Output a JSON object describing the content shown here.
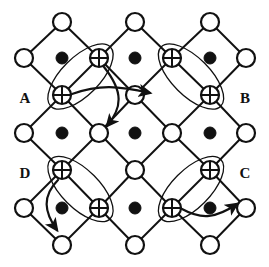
{
  "figure": {
    "width": 269,
    "height": 267,
    "background_color": "#ffffff",
    "stroke_color": "#111111",
    "fill_open": "#ffffff",
    "fill_solid": "#111111"
  },
  "labels": [
    {
      "id": "A",
      "text": "A",
      "x": 25,
      "y": 100
    },
    {
      "id": "B",
      "text": "B",
      "x": 245,
      "y": 100
    },
    {
      "id": "D",
      "text": "D",
      "x": 25,
      "y": 175
    },
    {
      "id": "C",
      "text": "C",
      "x": 245,
      "y": 175
    }
  ],
  "geometry": {
    "rows_y": [
      22,
      58,
      95,
      133,
      170,
      208,
      245
    ],
    "cols_x": [
      24,
      62,
      99,
      135,
      172,
      210,
      246
    ],
    "node_radius_open": 9,
    "node_radius_crossed": 9,
    "dot_radius": 6,
    "edge_width": 2.0,
    "ellipse_width": 1.3,
    "arrow_width": 2.2
  },
  "nodes": {
    "open_circles": [
      {
        "x": 62,
        "y": 22,
        "name": "node-r0-c1"
      },
      {
        "x": 135,
        "y": 22,
        "name": "node-r0-c3"
      },
      {
        "x": 210,
        "y": 22,
        "name": "node-r0-c5"
      },
      {
        "x": 24,
        "y": 58,
        "name": "node-r1-c0"
      },
      {
        "x": 246,
        "y": 58,
        "name": "node-r1-c6"
      },
      {
        "x": 135,
        "y": 95,
        "name": "node-r2-c3"
      },
      {
        "x": 24,
        "y": 133,
        "name": "node-r3-c0"
      },
      {
        "x": 99,
        "y": 133,
        "name": "node-r3-c2"
      },
      {
        "x": 172,
        "y": 133,
        "name": "node-r3-c4"
      },
      {
        "x": 246,
        "y": 133,
        "name": "node-r3-c6"
      },
      {
        "x": 135,
        "y": 170,
        "name": "node-r4-c3"
      },
      {
        "x": 24,
        "y": 208,
        "name": "node-r5-c0"
      },
      {
        "x": 246,
        "y": 208,
        "name": "node-r5-c6"
      },
      {
        "x": 62,
        "y": 245,
        "name": "node-r6-c1"
      },
      {
        "x": 135,
        "y": 245,
        "name": "node-r6-c3"
      },
      {
        "x": 210,
        "y": 245,
        "name": "node-r6-c5"
      }
    ],
    "crossed_circles": [
      {
        "x": 99,
        "y": 58,
        "name": "crossed-node-r1-c2",
        "group": "A"
      },
      {
        "x": 62,
        "y": 95,
        "name": "crossed-node-r2-c1",
        "group": "A"
      },
      {
        "x": 172,
        "y": 58,
        "name": "crossed-node-r1-c4",
        "group": "B"
      },
      {
        "x": 210,
        "y": 95,
        "name": "crossed-node-r2-c5",
        "group": "B"
      },
      {
        "x": 62,
        "y": 170,
        "name": "crossed-node-r4-c1",
        "group": "D"
      },
      {
        "x": 99,
        "y": 208,
        "name": "crossed-node-r5-c2",
        "group": "D"
      },
      {
        "x": 210,
        "y": 170,
        "name": "crossed-node-r4-c5",
        "group": "C"
      },
      {
        "x": 172,
        "y": 208,
        "name": "crossed-node-r5-c4",
        "group": "C"
      }
    ],
    "solid_dots": [
      {
        "x": 62,
        "y": 58,
        "name": "dot-r1-c1"
      },
      {
        "x": 135,
        "y": 58,
        "name": "dot-r1-c3"
      },
      {
        "x": 210,
        "y": 58,
        "name": "dot-r1-c5"
      },
      {
        "x": 62,
        "y": 133,
        "name": "dot-r3-c1"
      },
      {
        "x": 135,
        "y": 133,
        "name": "dot-r3-c3"
      },
      {
        "x": 210,
        "y": 133,
        "name": "dot-r3-c5"
      },
      {
        "x": 62,
        "y": 208,
        "name": "dot-r5-c1"
      },
      {
        "x": 135,
        "y": 208,
        "name": "dot-r5-c3"
      },
      {
        "x": 210,
        "y": 208,
        "name": "dot-r5-c5"
      }
    ]
  },
  "edges": [
    [
      62,
      22,
      24,
      58
    ],
    [
      62,
      22,
      99,
      58
    ],
    [
      135,
      22,
      99,
      58
    ],
    [
      135,
      22,
      172,
      58
    ],
    [
      210,
      22,
      172,
      58
    ],
    [
      210,
      22,
      246,
      58
    ],
    [
      24,
      58,
      62,
      95
    ],
    [
      99,
      58,
      62,
      95
    ],
    [
      99,
      58,
      135,
      95
    ],
    [
      172,
      58,
      135,
      95
    ],
    [
      172,
      58,
      210,
      95
    ],
    [
      246,
      58,
      210,
      95
    ],
    [
      62,
      95,
      24,
      133
    ],
    [
      62,
      95,
      99,
      133
    ],
    [
      135,
      95,
      99,
      133
    ],
    [
      135,
      95,
      172,
      133
    ],
    [
      210,
      95,
      172,
      133
    ],
    [
      210,
      95,
      246,
      133
    ],
    [
      24,
      133,
      62,
      170
    ],
    [
      99,
      133,
      62,
      170
    ],
    [
      99,
      133,
      135,
      170
    ],
    [
      172,
      133,
      135,
      170
    ],
    [
      172,
      133,
      210,
      170
    ],
    [
      246,
      133,
      210,
      170
    ],
    [
      62,
      170,
      24,
      208
    ],
    [
      62,
      170,
      99,
      208
    ],
    [
      135,
      170,
      99,
      208
    ],
    [
      135,
      170,
      172,
      208
    ],
    [
      210,
      170,
      172,
      208
    ],
    [
      210,
      170,
      246,
      208
    ],
    [
      24,
      208,
      62,
      245
    ],
    [
      99,
      208,
      62,
      245
    ],
    [
      99,
      208,
      135,
      245
    ],
    [
      172,
      208,
      135,
      245
    ],
    [
      172,
      208,
      210,
      245
    ],
    [
      246,
      208,
      210,
      245
    ]
  ],
  "ellipses": [
    {
      "name": "pair-ellipse-A",
      "cx": 80.5,
      "cy": 76.5,
      "rx": 42,
      "ry": 19,
      "rotation": -45
    },
    {
      "name": "pair-ellipse-B",
      "cx": 191,
      "cy": 76.5,
      "rx": 42,
      "ry": 19,
      "rotation": 45
    },
    {
      "name": "pair-ellipse-D",
      "cx": 80.5,
      "cy": 189,
      "rx": 42,
      "ry": 19,
      "rotation": 45
    },
    {
      "name": "pair-ellipse-C",
      "cx": 191,
      "cy": 189,
      "rx": 42,
      "ry": 19,
      "rotation": -45
    }
  ],
  "arrows": [
    {
      "name": "arrow-A-horizontal",
      "group": "A",
      "path": "M 72 94 C 100 84, 118 86, 150 93",
      "from": "crossed-node-r2-c1",
      "to": "node-r2-c3"
    },
    {
      "name": "arrow-A-vertical",
      "group": "A",
      "path": "M 104 67 C 124 92, 122 108, 107 126",
      "from": "crossed-node-r1-c2",
      "to": "node-r3-c2"
    },
    {
      "name": "arrow-D-diagonal",
      "group": "D",
      "path": "M 58 180 C 42 196, 44 212, 57 230",
      "from": "crossed-node-r4-c1",
      "to": "node-r6-c1"
    },
    {
      "name": "arrow-C-horizontal",
      "group": "C",
      "path": "M 182 209 C 202 220, 216 218, 237 204",
      "from": "crossed-node-r5-c4",
      "to": "node-r5-c6"
    }
  ]
}
